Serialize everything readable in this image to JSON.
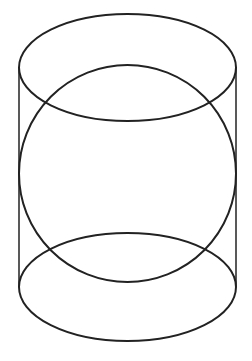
{
  "figure": {
    "stroke_color": "#222222",
    "background": "#ffffff",
    "caption": ""
  },
  "shapes": {
    "top_ellipse": {
      "cx": 127.5,
      "cy": 67.5,
      "rx": 108.5,
      "ry": 53.5
    },
    "bottom_ellipse": {
      "cx": 127.5,
      "cy": 287,
      "rx": 108.5,
      "ry": 54
    },
    "sphere": {
      "cx": 127.5,
      "cy": 173.5,
      "rx": 108.5,
      "ry": 108.5
    },
    "left_edge": {
      "x": 19,
      "y1": 67.5,
      "y2": 287
    },
    "right_edge": {
      "x": 236,
      "y1": 67.5,
      "y2": 287
    }
  }
}
